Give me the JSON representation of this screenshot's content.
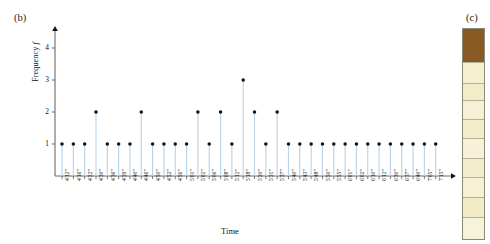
{
  "figure": {
    "panel_b_label": "(b)",
    "panel_c_label": "(c)"
  },
  "chart_data": {
    "type": "bar",
    "style": "stem",
    "title": "",
    "subtitle": "",
    "xlabel": "Time",
    "ylabel": "Frequency f",
    "ylim": [
      0,
      4.6
    ],
    "yticks": [
      1,
      2,
      3,
      4
    ],
    "ytick_labels": [
      "1",
      "2",
      "3",
      "4"
    ],
    "grid": false,
    "legend": null,
    "axis_arrows": true,
    "marker": "filled-circle",
    "marker_color": "#111111",
    "stem_color": "#b9d4e8",
    "categories": [
      "4'12\"",
      "4'16\"",
      "4'22\"",
      "4'30\"",
      "4'36\"",
      "4'39\"",
      "4'40\"",
      "4'46\"",
      "4'50\"",
      "4'52\"",
      "4'56\"",
      "5'01\"",
      "5'02\"",
      "5'06\"",
      "5'08\"",
      "5'12\"",
      "5'18\"",
      "5'20\"",
      "5'31\"",
      "5'37\"",
      "5'40\"",
      "5'43\"",
      "5'48\"",
      "5'50\"",
      "5'55\"",
      "6'01\"",
      "6'02\"",
      "6'10\"",
      "6'12\"",
      "6'30\"",
      "6'37\"",
      "6'40\"",
      "7'05\"",
      "7'15\""
    ],
    "values": [
      1,
      1,
      1,
      2,
      1,
      1,
      1,
      2,
      1,
      1,
      1,
      1,
      2,
      1,
      2,
      1,
      3,
      2,
      1,
      2,
      1,
      1,
      1,
      1,
      1,
      1,
      1,
      1,
      1,
      1,
      1,
      1,
      1,
      1
    ]
  },
  "core_column": {
    "segments": [
      {
        "name": "brown-unit",
        "color": "#8a5a24",
        "height_pct": 15.5
      },
      {
        "name": "pale-unit-1",
        "color": "#f6efd2",
        "height_pct": 10.0
      },
      {
        "name": "pale-unit-2",
        "color": "#f3ecc9",
        "height_pct": 8.5
      },
      {
        "name": "pale-unit-3",
        "color": "#f6f0d6",
        "height_pct": 9.0
      },
      {
        "name": "pale-unit-4",
        "color": "#f2ecc8",
        "height_pct": 9.0
      },
      {
        "name": "pale-unit-5",
        "color": "#f7f1d8",
        "height_pct": 9.5
      },
      {
        "name": "pale-unit-6",
        "color": "#f3edcd",
        "height_pct": 9.0
      },
      {
        "name": "pale-unit-7",
        "color": "#f6f0d4",
        "height_pct": 9.5
      },
      {
        "name": "pale-unit-8",
        "color": "#f2ebc6",
        "height_pct": 9.5
      },
      {
        "name": "pale-unit-9",
        "color": "#f7f2da",
        "height_pct": 10.5
      }
    ]
  }
}
